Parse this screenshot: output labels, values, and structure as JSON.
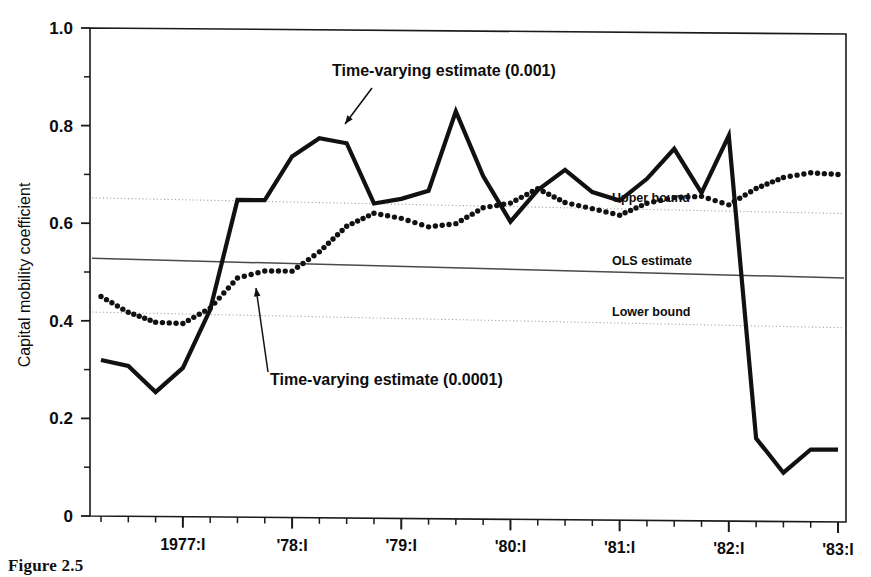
{
  "figure": {
    "caption": "Figure 2.5"
  },
  "chart_data": {
    "type": "line",
    "title": "",
    "xlabel": "",
    "ylabel": "Capital mobility coefficient",
    "ylim": [
      0,
      1.0
    ],
    "ytick_labels": [
      "0",
      "0.2",
      "0.4",
      "0.6",
      "0.8",
      "1.0"
    ],
    "ytick_values": [
      0,
      0.2,
      0.4,
      0.6,
      0.8,
      1.0
    ],
    "yminor_values": [
      0.1,
      0.3,
      0.5,
      0.7,
      0.9
    ],
    "grid": false,
    "legend_position": "inline-annotations",
    "xtick_labels": [
      "1977:I",
      "'78:I",
      "'79:I",
      "'80:I",
      "'81:I",
      "'82:I",
      "'83:I"
    ],
    "xtick_years": [
      1977,
      1978,
      1979,
      1980,
      1981,
      1982,
      1983
    ],
    "x_quarters": [
      "1976:II",
      "1976:III",
      "1976:IV",
      "1977:I",
      "1977:II",
      "1977:III",
      "1977:IV",
      "1978:I",
      "1978:II",
      "1978:III",
      "1978:IV",
      "1979:I",
      "1979:II",
      "1979:III",
      "1979:IV",
      "1980:I",
      "1980:II",
      "1980:III",
      "1980:IV",
      "1981:I",
      "1981:II",
      "1981:III",
      "1981:IV",
      "1982:I",
      "1982:II",
      "1982:III",
      "1982:IV",
      "1983:I"
    ],
    "series": [
      {
        "name": "Time-varying estimate (0.001)",
        "style": "solid",
        "values": [
          0.32,
          0.308,
          0.255,
          0.305,
          0.425,
          0.65,
          0.65,
          0.74,
          0.778,
          0.768,
          0.645,
          0.655,
          0.672,
          0.835,
          0.703,
          0.61,
          0.675,
          0.717,
          0.672,
          0.655,
          0.7,
          0.762,
          0.672,
          0.79,
          0.17,
          0.1,
          0.148,
          0.148
        ]
      },
      {
        "name": "Time-varying estimate (0.0001)",
        "style": "dotted",
        "values": [
          0.45,
          0.418,
          0.398,
          0.396,
          0.428,
          0.49,
          0.505,
          0.505,
          0.545,
          0.598,
          0.625,
          0.615,
          0.598,
          0.605,
          0.638,
          0.648,
          0.678,
          0.65,
          0.638,
          0.625,
          0.65,
          0.662,
          0.665,
          0.648,
          0.682,
          0.705,
          0.715,
          0.712
        ]
      }
    ],
    "reference_lines": [
      {
        "name": "Upper bound",
        "label": "Upper bound",
        "style": "dotted",
        "value_start": 0.652,
        "value_end": 0.632
      },
      {
        "name": "OLS estimate",
        "label": "OLS estimate",
        "style": "solid",
        "value_start": 0.528,
        "value_end": 0.5
      },
      {
        "name": "Lower bound",
        "label": "Lower bound",
        "style": "dotted",
        "value_start": 0.418,
        "value_end": 0.398
      }
    ],
    "annotations": [
      {
        "name": "upper-series-annotation",
        "label": "Time-varying estimate (0.001)"
      },
      {
        "name": "lower-series-annotation",
        "label": "Time-varying estimate (0.0001)"
      }
    ],
    "colors": {
      "ink": "#111111",
      "reference_faint": "#9a9a9a",
      "background": "#ffffff"
    }
  }
}
